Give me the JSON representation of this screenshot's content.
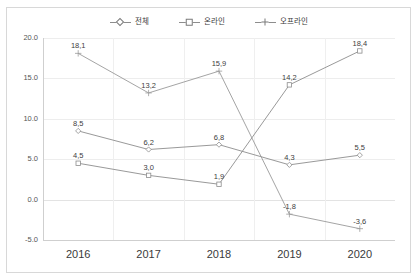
{
  "chart_data": {
    "type": "line",
    "title": "",
    "xlabel": "",
    "ylabel": "",
    "categories": [
      "2016",
      "2017",
      "2018",
      "2019",
      "2020"
    ],
    "ylim": [
      -5.0,
      20.0
    ],
    "yticks": [
      "20.0",
      "15.0",
      "10.0",
      "5.0",
      "0.0",
      "-5.0"
    ],
    "ytick_values": [
      20.0,
      15.0,
      10.0,
      5.0,
      0.0,
      -5.0
    ],
    "grid": true,
    "legend_position": "top-center",
    "series": [
      {
        "name": "전체",
        "marker": "diamond",
        "color": "#8d8d8d",
        "values": [
          8.5,
          6.2,
          6.8,
          4.3,
          5.5
        ],
        "labels": [
          "8,5",
          "6,2",
          "6,8",
          "4,3",
          "5,5"
        ]
      },
      {
        "name": "온라인",
        "marker": "square",
        "color": "#8d8d8d",
        "values": [
          4.5,
          3.0,
          1.9,
          14.2,
          18.4
        ],
        "labels": [
          "4,5",
          "3,0",
          "1,9",
          "14,2",
          "18,4"
        ]
      },
      {
        "name": "오프라인",
        "marker": "cross",
        "color": "#9a9a9a",
        "values": [
          18.1,
          13.2,
          15.9,
          -1.8,
          -3.6
        ],
        "labels": [
          "18,1",
          "13,2",
          "15,9",
          "-1,8",
          "-3,6"
        ]
      }
    ]
  }
}
